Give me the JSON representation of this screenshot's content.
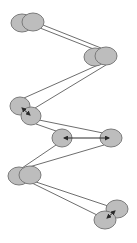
{
  "diagram": {
    "width": 137,
    "height": 243,
    "colors": {
      "background": "#ffffff",
      "node_fill": "#bdbdbd",
      "node_stroke": "#7a7a7a",
      "edge": "#6e6e6e",
      "arrow": "#2a2a2a"
    },
    "nodes": [
      {
        "id": "n1a",
        "cx": 22,
        "cy": 23,
        "rx": 11,
        "ry": 9
      },
      {
        "id": "n1b",
        "cx": 33,
        "cy": 22,
        "rx": 11,
        "ry": 9
      },
      {
        "id": "n2a",
        "cx": 95,
        "cy": 57,
        "rx": 11,
        "ry": 9
      },
      {
        "id": "n2b",
        "cx": 106,
        "cy": 56,
        "rx": 11,
        "ry": 9
      },
      {
        "id": "n3a",
        "cx": 20,
        "cy": 106,
        "rx": 10,
        "ry": 9
      },
      {
        "id": "n3b",
        "cx": 31,
        "cy": 116,
        "rx": 10,
        "ry": 9
      },
      {
        "id": "n4a",
        "cx": 62,
        "cy": 138,
        "rx": 10,
        "ry": 9
      },
      {
        "id": "n4b",
        "cx": 111,
        "cy": 138,
        "rx": 11,
        "ry": 9
      },
      {
        "id": "n5a",
        "cx": 19,
        "cy": 176,
        "rx": 11,
        "ry": 9
      },
      {
        "id": "n5b",
        "cx": 30,
        "cy": 175,
        "rx": 11,
        "ry": 9
      },
      {
        "id": "n6a",
        "cx": 117,
        "cy": 209,
        "rx": 11,
        "ry": 9
      },
      {
        "id": "n6b",
        "cx": 105,
        "cy": 220,
        "rx": 11,
        "ry": 9
      }
    ],
    "edges": [
      {
        "x1": 40,
        "y1": 28,
        "x2": 96,
        "y2": 50
      },
      {
        "x1": 43,
        "y1": 25,
        "x2": 101,
        "y2": 48
      },
      {
        "x1": 98,
        "y1": 65,
        "x2": 24,
        "y2": 98
      },
      {
        "x1": 106,
        "y1": 65,
        "x2": 35,
        "y2": 108
      },
      {
        "x1": 39,
        "y1": 120,
        "x2": 103,
        "y2": 133
      },
      {
        "x1": 36,
        "y1": 124,
        "x2": 56,
        "y2": 131
      },
      {
        "x1": 56,
        "y1": 145,
        "x2": 22,
        "y2": 168
      },
      {
        "x1": 104,
        "y1": 145,
        "x2": 29,
        "y2": 167
      },
      {
        "x1": 36,
        "y1": 182,
        "x2": 108,
        "y2": 206
      },
      {
        "x1": 32,
        "y1": 183,
        "x2": 97,
        "y2": 215
      }
    ],
    "arrows": [
      {
        "x1": 22,
        "y1": 108,
        "x2": 30,
        "y2": 115,
        "both": true
      },
      {
        "x1": 64,
        "y1": 138,
        "x2": 109,
        "y2": 138,
        "both": true
      },
      {
        "x1": 115,
        "y1": 211,
        "x2": 107,
        "y2": 218,
        "both": true
      }
    ]
  }
}
